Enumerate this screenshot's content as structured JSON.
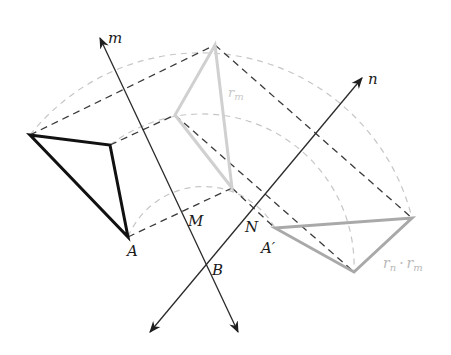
{
  "figure": {
    "type": "geometric-construction",
    "colors": {
      "axis": "#2a2a2a",
      "original_triangle": "#111111",
      "first_image_triangle": "#cfcfcf",
      "second_image_triangle": "#a8a8a8",
      "dashed_connectors": "#3a3a3a",
      "arcs": "#c4c4c4"
    }
  },
  "labels": {
    "line_m": "m",
    "line_n": "n",
    "point_M": "M",
    "point_N": "N",
    "point_A": "A",
    "point_B": "B",
    "point_A_prime": "A′",
    "reflection_m": "r",
    "reflection_m_sub": "m",
    "composition_rn": "r",
    "composition_rn_sub": "n",
    "composition_dot": "·",
    "composition_rm": "r",
    "composition_rm_sub": "m"
  },
  "geometry": {
    "center_B": [
      205,
      265
    ],
    "line_m": {
      "from": [
        238,
        332
      ],
      "to": [
        100,
        38
      ]
    },
    "line_n": {
      "from": [
        150,
        332
      ],
      "to": [
        362,
        78
      ]
    },
    "triangle_original": [
      [
        30,
        135
      ],
      [
        110,
        145
      ],
      [
        128,
        237
      ]
    ],
    "triangle_reflected_m": [
      [
        215,
        45
      ],
      [
        175,
        115
      ],
      [
        232,
        188
      ]
    ],
    "triangle_rotated": [
      [
        275,
        228
      ],
      [
        412,
        218
      ],
      [
        354,
        272
      ]
    ]
  }
}
